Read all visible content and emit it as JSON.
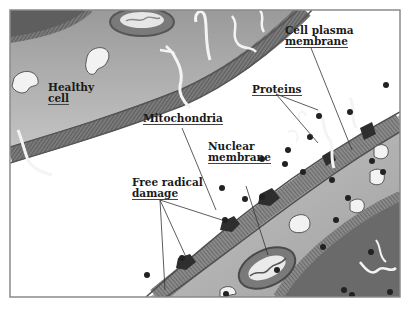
{
  "diagram": {
    "labels": {
      "healthy_cell": [
        "Healthy",
        "cell"
      ],
      "cell_plasma_membrane": [
        "Cell plasma",
        "membrane"
      ],
      "proteins": "Proteins",
      "mitochondria": "Mitochondria",
      "nuclear_membrane": [
        "Nuclear",
        "membrane"
      ],
      "free_radical_damage": [
        "Free radical",
        "damage"
      ]
    },
    "caption_truncated": "",
    "colors": {
      "frame": "#8a8a8a",
      "cytoplasm": "#b8b8b8",
      "membrane_dark": "#5a5a5a",
      "membrane_mid": "#7d7d7d",
      "nucleus": "#6e6e6e",
      "free_radical": "#222222",
      "protein": "#f4f4f4",
      "background": "#ffffff"
    }
  }
}
